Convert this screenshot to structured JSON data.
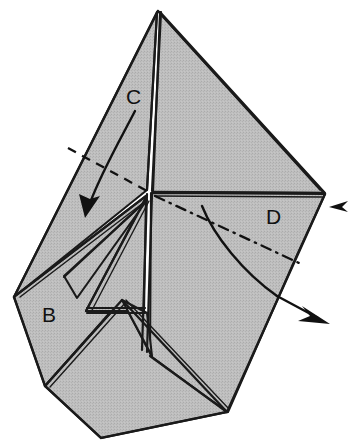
{
  "figure": {
    "kind": "line-drawing",
    "background_color": "#ffffff",
    "paper_fill_color": "#b9b9b9",
    "ink_color": "#111111",
    "width": 355,
    "height": 447
  },
  "labels": [
    {
      "id": "C",
      "text": "C",
      "x": 126,
      "y": 104
    },
    {
      "id": "B",
      "text": "B",
      "x": 42,
      "y": 322
    },
    {
      "id": "D",
      "text": "D",
      "x": 266,
      "y": 224
    }
  ],
  "annotations": {
    "fold_lines": [
      {
        "name": "valley-fold-dashed-left",
        "style": "dashed",
        "from": [
          69,
          149
        ],
        "to": [
          148,
          192
        ]
      },
      {
        "name": "fold-dash-dot-right",
        "style": "dash-dot",
        "from": [
          152,
          194
        ],
        "to": [
          298,
          262
        ]
      }
    ],
    "arrows": [
      {
        "name": "fold-arrow-C",
        "direction": "down-left",
        "tail": [
          134,
          112
        ],
        "tip": [
          85,
          216
        ]
      },
      {
        "name": "fold-arrow-D",
        "direction": "down-right",
        "tail": [
          203,
          206
        ],
        "tip": [
          328,
          323
        ]
      },
      {
        "name": "small-pointer-arrow-right-edge",
        "direction": "left",
        "tip": [
          327,
          207
        ]
      }
    ]
  },
  "geometry": {
    "apex": [
      158,
      11
    ],
    "center_vertex": [
      148,
      192
    ],
    "right_vertex": [
      325,
      194
    ],
    "left_vertex": [
      14,
      297
    ],
    "bottom_vertex": [
      227,
      412
    ],
    "facets": [
      {
        "name": "facet-upper-left",
        "points": "158,12 148,190 14,297 36,238"
      },
      {
        "name": "facet-upper-right",
        "points": "160,12 325,194 151,192"
      },
      {
        "name": "facet-right-lower",
        "points": "151,193 325,194 228,412 150,360"
      },
      {
        "name": "facet-left-lower",
        "points": "14,297 146,196 120,300 45,386"
      },
      {
        "name": "facet-bottom-flap",
        "points": "45,386 120,300 150,358 228,412 100,438"
      },
      {
        "name": "facet-narrow-sliver",
        "points": "146,196 88,309 143,309"
      }
    ]
  }
}
